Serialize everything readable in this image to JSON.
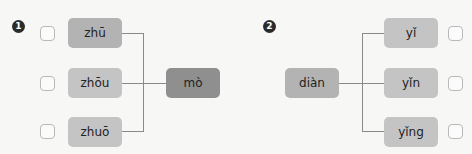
{
  "exercises": [
    {
      "number": "1",
      "options": [
        {
          "label": "zhū",
          "checked": false
        },
        {
          "label": "zhōu",
          "checked": false
        },
        {
          "label": "zhuō",
          "checked": false
        }
      ],
      "target": {
        "label": "mò"
      }
    },
    {
      "number": "2",
      "source": {
        "label": "diàn"
      },
      "options": [
        {
          "label": "yǐ",
          "checked": false
        },
        {
          "label": "yǐn",
          "checked": false
        },
        {
          "label": "yǐng",
          "checked": false
        }
      ]
    }
  ],
  "colors": {
    "box": "#b3b3b3",
    "box_dark": "#8f8f8f",
    "line": "#8a8a8a",
    "badge": "#2b2b2b"
  }
}
